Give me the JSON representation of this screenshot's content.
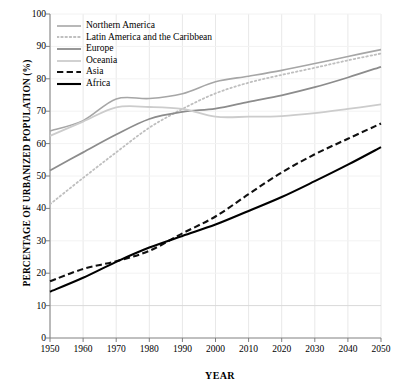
{
  "chart_data": {
    "type": "line",
    "title": "",
    "xlabel": "YEAR",
    "ylabel": "PERCENTAGE OF URBANIZED POPULATION (%)",
    "x": [
      1950,
      1960,
      1970,
      1980,
      1990,
      2000,
      2010,
      2020,
      2030,
      2040,
      2050
    ],
    "xlim": [
      1950,
      2050
    ],
    "ylim": [
      0,
      100
    ],
    "yticks": [
      0,
      10,
      20,
      30,
      40,
      50,
      60,
      70,
      80,
      90,
      100
    ],
    "xticks": [
      1950,
      1960,
      1970,
      1980,
      1990,
      2000,
      2010,
      2020,
      2030,
      2040,
      2050
    ],
    "grid": "light horizontal and vertical gridlines",
    "legend_position": "top-left inside plot area",
    "series": [
      {
        "name": "Northern America",
        "style": "solid",
        "color": "#a6a6a6",
        "width": 1.6,
        "values": [
          63.9,
          67.1,
          73.8,
          73.9,
          75.4,
          79.1,
          80.8,
          82.6,
          84.7,
          86.9,
          89.0
        ]
      },
      {
        "name": "Latin America and the Caribbean",
        "style": "dotted",
        "color": "#bfbfbf",
        "width": 1.8,
        "values": [
          41.3,
          49.4,
          57.3,
          64.9,
          70.7,
          75.5,
          78.8,
          81.2,
          83.4,
          85.7,
          87.8
        ]
      },
      {
        "name": "Europe",
        "style": "solid",
        "color": "#8c8c8c",
        "width": 1.8,
        "values": [
          51.7,
          57.3,
          62.8,
          67.6,
          69.8,
          70.8,
          72.9,
          74.9,
          77.4,
          80.4,
          83.7
        ]
      },
      {
        "name": "Oceania",
        "style": "solid",
        "color": "#cccccc",
        "width": 1.8,
        "values": [
          62.4,
          66.8,
          71.2,
          71.3,
          70.7,
          68.3,
          68.3,
          68.5,
          69.4,
          70.7,
          72.1
        ]
      },
      {
        "name": "Asia",
        "style": "dashed",
        "color": "#111111",
        "width": 2.1,
        "values": [
          17.5,
          21.3,
          23.7,
          26.9,
          32.3,
          37.5,
          44.4,
          51.1,
          56.7,
          61.5,
          66.2
        ]
      },
      {
        "name": "Africa",
        "style": "solid",
        "color": "#000000",
        "width": 2.1,
        "values": [
          14.3,
          18.6,
          23.5,
          27.9,
          31.5,
          35.0,
          39.2,
          43.5,
          48.4,
          53.5,
          58.9
        ]
      }
    ]
  },
  "axes": {
    "y_tick_labels": [
      "100",
      "90",
      "80",
      "70",
      "60",
      "50",
      "40",
      "30",
      "20",
      "10",
      "0"
    ],
    "x_tick_labels": [
      "1950",
      "1960",
      "1970",
      "1980",
      "1990",
      "2000",
      "2010",
      "2020",
      "2030",
      "2040",
      "2050"
    ],
    "x_title": "YEAR",
    "y_title": "PERCENTAGE OF URBANIZED POPULATION (%)"
  },
  "legend": {
    "items": [
      {
        "label": "Northern America"
      },
      {
        "label": "Latin America and the Caribbean"
      },
      {
        "label": "Europe"
      },
      {
        "label": "Oceania"
      },
      {
        "label": "Asia"
      },
      {
        "label": "Africa"
      }
    ]
  },
  "colors": {
    "axis": "#808080",
    "grid": "#e8e8e8",
    "background": "#ffffff"
  }
}
